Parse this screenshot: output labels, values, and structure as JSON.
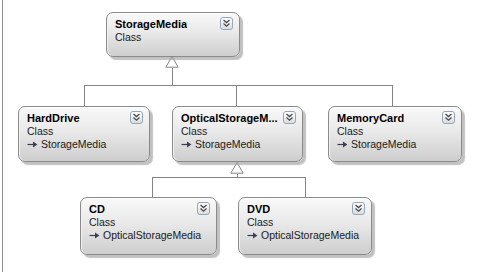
{
  "diagram": {
    "type": "uml-class-diagram",
    "background_color": "#ffffff",
    "node_border_color": "#8a8a8a",
    "node_fill_top": "#f9f9f9",
    "node_fill_bottom": "#cecece",
    "connector_color": "#848484",
    "stereotype_label": "Class",
    "icons": {
      "collapse": "chevron-double-down-icon",
      "inherits": "arrow-right-icon"
    },
    "nodes": [
      {
        "title": "StorageMedia",
        "stereotype": "Class",
        "base": ""
      },
      {
        "title": "HardDrive",
        "stereotype": "Class",
        "base": "StorageMedia"
      },
      {
        "title": "OpticalStorageM...",
        "stereotype": "Class",
        "base": "StorageMedia"
      },
      {
        "title": "MemoryCard",
        "stereotype": "Class",
        "base": "StorageMedia"
      },
      {
        "title": "CD",
        "stereotype": "Class",
        "base": "OpticalStorageMedia"
      },
      {
        "title": "DVD",
        "stereotype": "Class",
        "base": "OpticalStorageMedia"
      }
    ],
    "relations": [
      {
        "from": "HardDrive",
        "to": "StorageMedia",
        "kind": "inheritance"
      },
      {
        "from": "OpticalStorageM...",
        "to": "StorageMedia",
        "kind": "inheritance"
      },
      {
        "from": "MemoryCard",
        "to": "StorageMedia",
        "kind": "inheritance"
      },
      {
        "from": "CD",
        "to": "OpticalStorageM...",
        "kind": "inheritance"
      },
      {
        "from": "DVD",
        "to": "OpticalStorageM...",
        "kind": "inheritance"
      }
    ]
  }
}
